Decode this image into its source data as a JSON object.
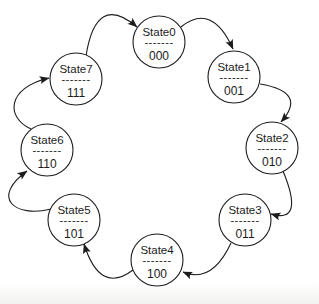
{
  "diagram": {
    "type": "state-machine-cycle",
    "separator": "-------",
    "states": [
      {
        "name": "State0",
        "code": "000"
      },
      {
        "name": "State1",
        "code": "001"
      },
      {
        "name": "State2",
        "code": "010"
      },
      {
        "name": "State3",
        "code": "011"
      },
      {
        "name": "State4",
        "code": "100"
      },
      {
        "name": "State5",
        "code": "101"
      },
      {
        "name": "State6",
        "code": "110"
      },
      {
        "name": "State7",
        "code": "111"
      }
    ],
    "transitions": [
      {
        "from": "State0",
        "to": "State1"
      },
      {
        "from": "State1",
        "to": "State2"
      },
      {
        "from": "State2",
        "to": "State3"
      },
      {
        "from": "State3",
        "to": "State4"
      },
      {
        "from": "State4",
        "to": "State5"
      },
      {
        "from": "State5",
        "to": "State6"
      },
      {
        "from": "State6",
        "to": "State7"
      },
      {
        "from": "State7",
        "to": "State0"
      }
    ],
    "colors": {
      "stroke": "#1c1c1c",
      "background": "#ffffff"
    }
  }
}
